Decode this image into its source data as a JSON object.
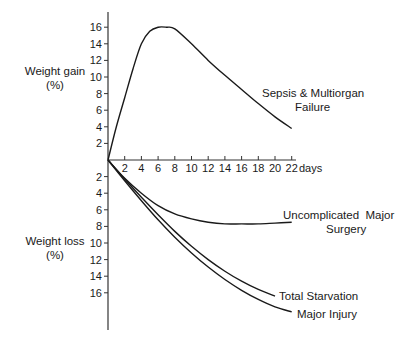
{
  "chart_data": {
    "type": "line",
    "title": "",
    "xlabel": "days",
    "ylabel_top": "Weight gain (%)",
    "ylabel_bottom": "Weight loss (%)",
    "x_ticks": [
      2,
      4,
      6,
      8,
      10,
      12,
      14,
      16,
      18,
      20,
      22
    ],
    "y_gain_ticks": [
      2,
      4,
      6,
      8,
      10,
      12,
      14,
      16
    ],
    "y_loss_ticks": [
      2,
      4,
      6,
      8,
      10,
      12,
      14,
      16
    ],
    "xlim": [
      0,
      22
    ],
    "ylim": [
      -20,
      18
    ],
    "grid": false,
    "legend": "inline labels at curve ends",
    "series": [
      {
        "name": "Sepsis & Multiorgan Failure",
        "x": [
          0,
          1,
          2,
          3,
          4,
          5,
          6,
          7,
          8,
          10,
          12,
          14,
          16,
          18,
          20,
          22
        ],
        "values": [
          0,
          4,
          7.5,
          11,
          14,
          15.5,
          16,
          16,
          15.8,
          14,
          12,
          10.2,
          8.5,
          6.8,
          5.2,
          3.8
        ]
      },
      {
        "name": "Uncomplicated Major Surgery",
        "x": [
          0,
          2,
          4,
          6,
          8,
          10,
          12,
          14,
          16,
          18,
          20,
          22
        ],
        "values": [
          0,
          -2.2,
          -4,
          -5.5,
          -6.5,
          -7.1,
          -7.5,
          -7.7,
          -7.7,
          -7.7,
          -7.6,
          -7.5
        ]
      },
      {
        "name": "Total Starvation",
        "x": [
          0,
          2,
          4,
          6,
          8,
          10,
          12,
          14,
          16,
          18,
          20
        ],
        "values": [
          0,
          -2.3,
          -4.5,
          -6.6,
          -8.6,
          -10.4,
          -12,
          -13.4,
          -14.6,
          -15.6,
          -16.4
        ]
      },
      {
        "name": "Major Injury",
        "x": [
          0,
          2,
          4,
          6,
          8,
          10,
          12,
          14,
          16,
          18,
          20,
          22
        ],
        "values": [
          0,
          -2.5,
          -4.9,
          -7.2,
          -9.3,
          -11.2,
          -12.9,
          -14.4,
          -15.7,
          -16.8,
          -17.7,
          -18.3
        ]
      }
    ]
  },
  "labels": {
    "gain_title_1": "Weight gain",
    "gain_title_2": "(%)",
    "loss_title_1": "Weight loss",
    "loss_title_2": "(%)",
    "days": "days",
    "sepsis_1": "Sepsis & Multiorgan",
    "sepsis_2": "Failure",
    "surgery_1": "Uncomplicated  Major",
    "surgery_2": "Surgery",
    "starvation": "Total Starvation",
    "injury": "Major Injury"
  }
}
